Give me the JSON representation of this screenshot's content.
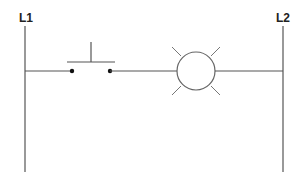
{
  "diagram": {
    "type": "ladder-logic",
    "title": "",
    "rails": {
      "left": {
        "label": "L1"
      },
      "right": {
        "label": "L2"
      }
    },
    "rung": {
      "components": [
        {
          "kind": "push-button",
          "state": "normally-open"
        },
        {
          "kind": "pilot-lamp",
          "state": "lit"
        }
      ]
    },
    "colors": {
      "wire": "#555555",
      "label": "#222222",
      "contact": "#111111",
      "background": "#ffffff"
    }
  }
}
